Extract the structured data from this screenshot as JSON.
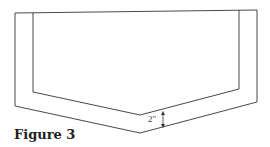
{
  "figure": {
    "caption": "Figure 3",
    "dimension_label": "2\"",
    "outer_outline": [
      [
        15,
        13
      ],
      [
        257,
        10
      ],
      [
        257,
        102
      ],
      [
        140,
        133
      ],
      [
        15,
        106
      ]
    ],
    "inner_outline": [
      [
        33,
        13
      ],
      [
        33,
        92
      ],
      [
        140,
        115
      ],
      [
        239,
        89
      ],
      [
        239,
        10
      ]
    ],
    "stroke_color": "#333333"
  }
}
